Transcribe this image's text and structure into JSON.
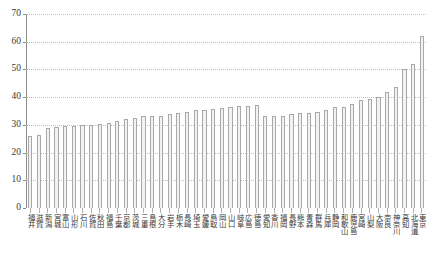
{
  "chart_data": {
    "type": "bar",
    "title": "",
    "subtitle": "",
    "xlabel": "",
    "ylabel": "",
    "ylim": [
      0,
      70
    ],
    "yticks": [
      0,
      10,
      20,
      30,
      40,
      50,
      60,
      70
    ],
    "ytick_labels": [
      "0",
      "10",
      "20",
      "30",
      "40",
      "50",
      "60",
      "70"
    ],
    "grid": true,
    "legend": false,
    "bar_color": "#f2f2f2",
    "bar_edge_color": "#a8a8a8",
    "axis_color": "#8c8c8c",
    "grid_color": "#bfbfbf",
    "categories": [
      "福井",
      "滋賀",
      "新潟",
      "宮城",
      "富山",
      "山形",
      "石川",
      "佐賀",
      "秋田",
      "福島",
      "千葉",
      "京都",
      "茨城",
      "三重",
      "島根",
      "大分",
      "岩手",
      "栃木",
      "長崎",
      "埼玉",
      "愛媛",
      "鳥取",
      "岡山",
      "山口",
      "岐阜",
      "広島",
      "徳島",
      "愛知",
      "香川",
      "福岡",
      "長野",
      "熊本",
      "青森",
      "群馬",
      "兵庫",
      "静岡",
      "和歌山",
      "鹿児島",
      "宮崎",
      "山梨",
      "大阪",
      "奈良",
      "神奈川",
      "高知",
      "北海道",
      "東京"
    ],
    "values": [
      26.0,
      26.5,
      29.0,
      29.3,
      29.5,
      29.7,
      30.0,
      30.0,
      30.4,
      30.8,
      31.3,
      32.2,
      32.5,
      33.2,
      33.3,
      33.3,
      34.0,
      34.3,
      34.8,
      35.3,
      35.4,
      35.8,
      36.0,
      36.3,
      36.8,
      36.8,
      37.0,
      33.2,
      33.2,
      33.3,
      34.0,
      34.2,
      34.4,
      34.6,
      35.4,
      36.4,
      36.6,
      37.4,
      39.0,
      39.2,
      40.0,
      41.8,
      43.6,
      50.2,
      52.0,
      62.0
    ]
  }
}
